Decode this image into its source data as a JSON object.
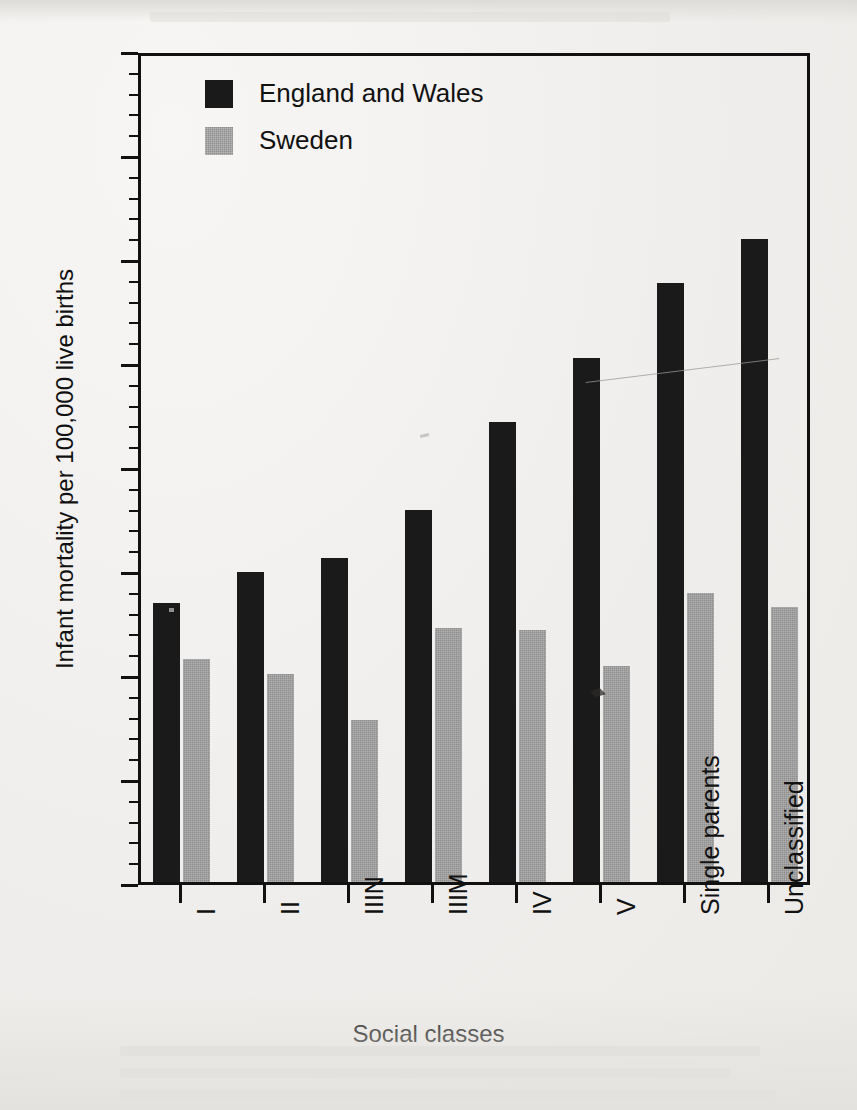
{
  "chart_data": {
    "type": "bar",
    "title": "",
    "xlabel": "Social classes",
    "ylabel": "Infant mortality per 100,000 live births",
    "ylim": [
      0,
      2000
    ],
    "ytick_step": 250,
    "yminor_step": 50,
    "grid": false,
    "legend_position": "top-left",
    "categories": [
      "I",
      "II",
      "IIIN",
      "IIIM",
      "IV",
      "V",
      "Single parents",
      "Unclassified"
    ],
    "ytick_labels": [
      "0",
      "250",
      "500",
      "750",
      "1000",
      "1250",
      "1500",
      "1750",
      "2000"
    ],
    "series": [
      {
        "name": "England and Wales",
        "color": "#1a1a1a",
        "values": [
          670,
          745,
          780,
          895,
          1105,
          1260,
          1440,
          1545
        ]
      },
      {
        "name": "Sweden",
        "color": "#8e8e8e",
        "values": [
          535,
          500,
          390,
          610,
          605,
          520,
          695,
          660
        ]
      }
    ]
  },
  "legend": {
    "entries": [
      {
        "label": "England and Wales",
        "swatch": "eng"
      },
      {
        "label": "Sweden",
        "swatch": "swe"
      }
    ]
  },
  "axis": {
    "x_title": "Social classes",
    "y_title": "Infant mortality per 100,000 live births"
  }
}
